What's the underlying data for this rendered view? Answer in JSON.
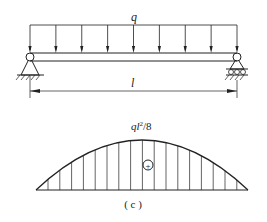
{
  "figure": {
    "load_label": "q",
    "span_label": "l",
    "moment_label_base": "ql",
    "moment_label_exp": "2",
    "moment_label_tail": "/8",
    "sign_symbol": "+",
    "caption": "( c )"
  },
  "beam": {
    "x_start": 30,
    "x_end": 237,
    "num_load_arrows": 9,
    "left_support": "pin",
    "right_support": "roller"
  },
  "moment_diagram": {
    "shape": "parabola",
    "max_value_label": "ql²/8",
    "sign": "positive",
    "hatch": "vertical"
  },
  "colors": {
    "line": "#222222",
    "background": "#ffffff"
  }
}
